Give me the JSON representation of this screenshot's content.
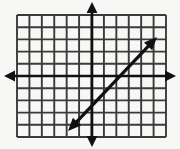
{
  "figure": {
    "name": "coordinate-grid-with-line",
    "width": 180,
    "height": 149,
    "background_color": "#f7f7f5",
    "title": "",
    "caption": ""
  },
  "chart_data": {
    "type": "line",
    "title": "",
    "subtitle": "",
    "xlabel": "",
    "ylabel": "",
    "grid": true,
    "legend_position": "none",
    "annotations": [],
    "tick_labels": {
      "x": [],
      "y": []
    },
    "axis_style": {
      "color": "#111111",
      "stroke_width": 2.6,
      "arrows": "both-ends-both-axes",
      "origin_px": {
        "x": 92,
        "y": 76
      }
    },
    "grid_style": {
      "color": "#3a3a3a",
      "stroke_width": 1.9,
      "cell_size_px": 12.4,
      "vertical_line_count": 13,
      "horizontal_line_count": 11,
      "left_px": 17,
      "right_px": 166,
      "top_px": 15,
      "bottom_px": 137
    },
    "xlim": [
      -6,
      6
    ],
    "ylim": [
      -5,
      5
    ],
    "series": [
      {
        "name": "line",
        "color": "#111111",
        "stroke_width": 3.2,
        "arrows": "both",
        "slope": 1,
        "y_intercept": -2.4,
        "endpoints_px": [
          {
            "x": 68,
            "y": 131
          },
          {
            "x": 157,
            "y": 37
          }
        ],
        "endpoints_units": [
          {
            "x": -2,
            "y": -4.5
          },
          {
            "x": 5.2,
            "y": 3.2
          }
        ],
        "points": [
          {
            "x": -2,
            "y": -4.5
          },
          {
            "x": 0,
            "y": -2.4
          },
          {
            "x": 2.4,
            "y": 0
          },
          {
            "x": 5.2,
            "y": 3.2
          }
        ]
      }
    ]
  }
}
